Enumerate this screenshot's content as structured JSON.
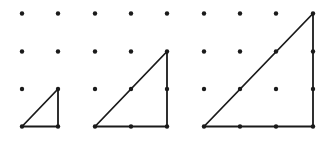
{
  "diagram": {
    "background": "#ffffff",
    "ink_color": "#1a1a1a",
    "dot_radius": 2.2,
    "line_width": 1.8,
    "rows_y": [
      13.5,
      51.5,
      89,
      126.5
    ],
    "grids": [
      {
        "name": "grid-small",
        "columns_x": [
          22,
          58
        ],
        "triangle": {
          "label": "1x1 right triangle",
          "points": [
            [
              22,
              126.5
            ],
            [
              58,
              126.5
            ],
            [
              58,
              89
            ]
          ]
        }
      },
      {
        "name": "grid-medium",
        "columns_x": [
          95,
          131,
          167
        ],
        "triangle": {
          "label": "2x2 right triangle",
          "points": [
            [
              95,
              126.5
            ],
            [
              167,
              126.5
            ],
            [
              167,
              51.5
            ]
          ]
        }
      },
      {
        "name": "grid-large",
        "columns_x": [
          204,
          240,
          276,
          313
        ],
        "triangle": {
          "label": "3x3 right triangle",
          "points": [
            [
              204,
              126.5
            ],
            [
              313,
              126.5
            ],
            [
              313,
              13.5
            ]
          ]
        }
      }
    ]
  }
}
